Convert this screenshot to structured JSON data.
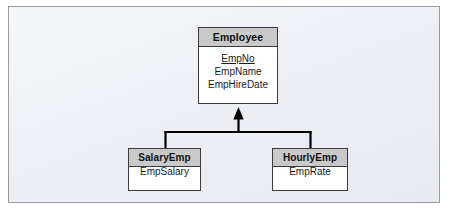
{
  "diagram": {
    "type": "uml-generalization-class-diagram",
    "frame_background": "#eef0f5",
    "frame_border_color": "#9a9ca1",
    "header_fill": "#c9c9c9",
    "box_border_color": "#3b3b3b",
    "connector_color": "#000000",
    "superclass": {
      "name": "Employee",
      "attributes": [
        {
          "label": "EmpNo",
          "is_key": true
        },
        {
          "label": "EmpName",
          "is_key": false
        },
        {
          "label": "EmpHireDate",
          "is_key": false
        }
      ]
    },
    "subclasses": [
      {
        "name": "SalaryEmp",
        "attributes": [
          {
            "label": "EmpSalary",
            "is_key": false
          }
        ]
      },
      {
        "name": "HourlyEmp",
        "attributes": [
          {
            "label": "EmpRate",
            "is_key": false
          }
        ]
      }
    ],
    "relationship": {
      "kind": "generalization",
      "arrow_style": "solid-filled-arrowhead",
      "direction": "subclasses-to-superclass"
    }
  }
}
